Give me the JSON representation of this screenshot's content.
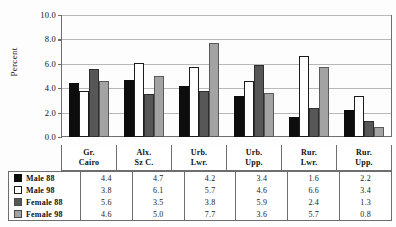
{
  "chart_data": {
    "type": "bar",
    "title": "",
    "xlabel": "",
    "ylabel": "Percent",
    "ylim": [
      0,
      10
    ],
    "ytick_labels": [
      "10.0",
      "8.0",
      "6.0",
      "4.0",
      "2.0",
      "0.0"
    ],
    "ytick_values": [
      10,
      8,
      6,
      4,
      2,
      0
    ],
    "grid": true,
    "legend_position": "table-left",
    "categories": [
      "Gr. Cairo",
      "Alx. Sz C.",
      "Urb. Lwr.",
      "Urb. Upp.",
      "Rur. Lwr.",
      "Rur. Upp."
    ],
    "category_lines": [
      [
        "Gr.",
        "Cairo"
      ],
      [
        "Alx.",
        "Sz C."
      ],
      [
        "Urb.",
        "Lwr."
      ],
      [
        "Urb.",
        "Upp."
      ],
      [
        "Rur.",
        "Lwr."
      ],
      [
        "Rur.",
        "Upp."
      ]
    ],
    "series": [
      {
        "name": "Male 88",
        "color": "#0d0d0d",
        "values": [
          4.4,
          4.7,
          4.2,
          3.4,
          1.6,
          2.2
        ]
      },
      {
        "name": "Male 98",
        "color": "#ffffff",
        "values": [
          3.8,
          6.1,
          5.7,
          4.6,
          6.6,
          3.4
        ]
      },
      {
        "name": "Female 88",
        "color": "#575757",
        "values": [
          5.6,
          3.5,
          3.8,
          5.9,
          2.4,
          1.3
        ]
      },
      {
        "name": "Female 98",
        "color": "#a3a3a3",
        "values": [
          4.6,
          5.0,
          7.7,
          3.6,
          5.7,
          0.8
        ]
      }
    ],
    "value_labels": [
      [
        "4.4",
        "4.7",
        "4.2",
        "3.4",
        "1.6",
        "2.2"
      ],
      [
        "3.8",
        "6.1",
        "5.7",
        "4.6",
        "6.6",
        "3.4"
      ],
      [
        "5.6",
        "3.5",
        "3.8",
        "5.9",
        "2.4",
        "1.3"
      ],
      [
        "4.6",
        "5.0",
        "7.7",
        "3.6",
        "5.7",
        "0.8"
      ]
    ]
  },
  "colors": {
    "axis": "#6e6e6e",
    "grid": "#b9b9b9",
    "text": "#111111",
    "background": "#fdfdfd"
  }
}
